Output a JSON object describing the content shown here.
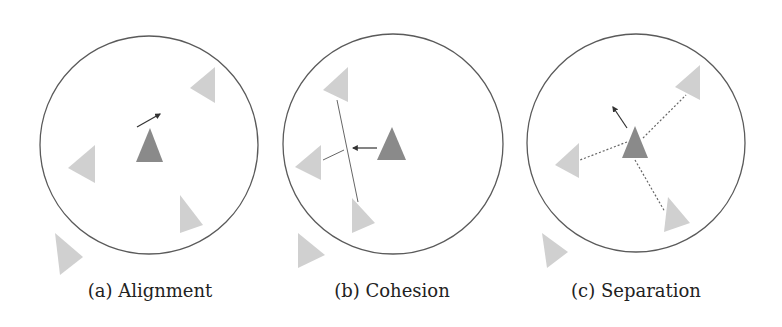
{
  "colors": {
    "circle_stroke": "#5a5a5a",
    "focal_boid": "#8a8a8a",
    "neighbor_boid": "#d0d0d0",
    "vector": "#333333",
    "guide_line": "#666666"
  },
  "panels": [
    {
      "id": "a",
      "caption": "(a) Alignment",
      "caption_x": 150,
      "circle": {
        "cx": 149,
        "cy": 145,
        "r": 109
      },
      "focal": "150,128 136,162 163,162",
      "neighbors": [
        "215,67 190,88 215,103",
        "95,145 68,168 95,183",
        "180,195 203,225 180,233",
        "55,233 83,257 60,275"
      ],
      "vector": {
        "x1": 137,
        "y1": 127,
        "x2": 160,
        "y2": 114
      },
      "lines": [],
      "dotted": []
    },
    {
      "id": "b",
      "caption": "(b) Cohesion",
      "caption_x": 392,
      "circle": {
        "cx": 393,
        "cy": 144,
        "r": 110
      },
      "focal": "392,127 377,160 406,160",
      "neighbors": [
        "348,67 323,90 348,102",
        "321,145 295,167 321,180",
        "352,198 375,223 352,233",
        "298,233 325,255 298,268"
      ],
      "vector": {
        "x1": 377,
        "y1": 148,
        "x2": 353,
        "y2": 148
      },
      "lines": [
        {
          "x1": 337,
          "y1": 100,
          "x2": 358,
          "y2": 202
        },
        {
          "x1": 323,
          "y1": 160,
          "x2": 344,
          "y2": 150
        }
      ],
      "dotted": []
    },
    {
      "id": "c",
      "caption": "(c) Separation",
      "caption_x": 636,
      "circle": {
        "cx": 636,
        "cy": 143,
        "r": 109
      },
      "focal": "635,126 622,158 648,158",
      "neighbors": [
        "700,65 675,87 700,100",
        "579,143 555,165 579,178",
        "668,197 690,223 664,232",
        "542,233 568,252 547,268"
      ],
      "vector": {
        "x1": 627,
        "y1": 128,
        "x2": 613,
        "y2": 107
      },
      "lines": [],
      "dotted": [
        {
          "x1": 643,
          "y1": 138,
          "x2": 686,
          "y2": 95
        },
        {
          "x1": 627,
          "y1": 142,
          "x2": 580,
          "y2": 160
        },
        {
          "x1": 635,
          "y1": 160,
          "x2": 665,
          "y2": 212
        }
      ]
    }
  ]
}
